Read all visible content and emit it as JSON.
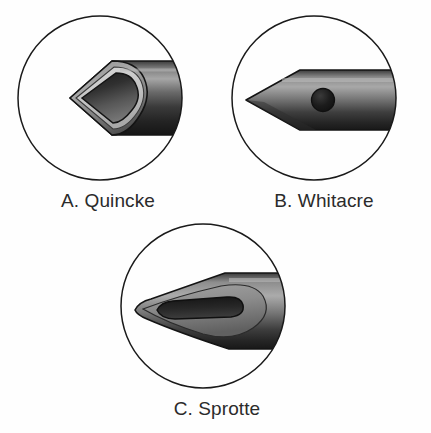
{
  "figure": {
    "background_color": "#fefefe",
    "caption_color": "#2b2b2b",
    "outline_color": "#1a1a1a",
    "panel_count": 3
  },
  "panels": [
    {
      "id": "a",
      "letter": "A.",
      "name": "Quincke",
      "caption": "A. Quincke",
      "tip_type": "cutting bevel",
      "aperture": "end-opening lumen at bevel",
      "aperture_shape": "teardrop",
      "frame_shape": "circle",
      "icon": "quincke-needle-icon"
    },
    {
      "id": "b",
      "letter": "B.",
      "name": "Whitacre",
      "caption": "B. Whitacre",
      "tip_type": "pencil point",
      "aperture": "round side port",
      "aperture_shape": "circle",
      "frame_shape": "circle",
      "icon": "whitacre-needle-icon"
    },
    {
      "id": "c",
      "letter": "C.",
      "name": "Sprotte",
      "caption": "C. Sprotte",
      "tip_type": "long tapered pencil point",
      "aperture": "elongated oval side port",
      "aperture_shape": "lozenge",
      "frame_shape": "circle",
      "icon": "sprotte-needle-icon"
    }
  ],
  "colors": {
    "shaft_light": "#9a9a9a",
    "shaft_mid": "#5e5e5e",
    "shaft_dark": "#232323",
    "lumen_dark": "#2a2a2a",
    "rim_light": "#c9c9c9",
    "stroke": "#141414"
  }
}
